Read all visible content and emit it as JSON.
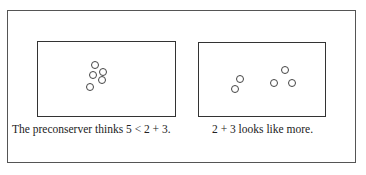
{
  "figure": {
    "panels": [
      {
        "id": "left",
        "caption": "The preconserver thinks 5 < 2 + 3.",
        "dots": [
          [
            95,
            65
          ],
          [
            93,
            75
          ],
          [
            103,
            72
          ],
          [
            102,
            80
          ],
          [
            90,
            87
          ]
        ]
      },
      {
        "id": "right",
        "caption": "2 + 3 looks like more.",
        "dots": [
          [
            240,
            79
          ],
          [
            235,
            89
          ],
          [
            285,
            70
          ],
          [
            274,
            83
          ],
          [
            292,
            83
          ]
        ]
      }
    ]
  }
}
